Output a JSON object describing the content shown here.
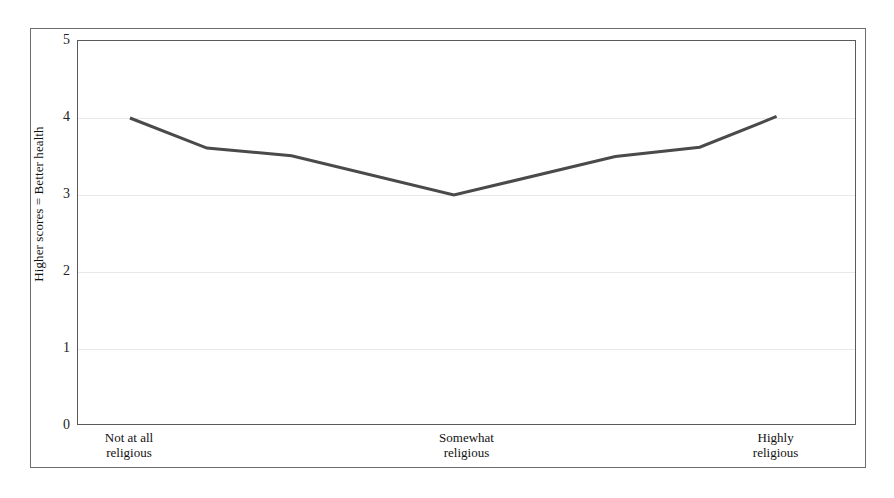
{
  "chart_data": {
    "type": "line",
    "title": "",
    "subtitle": "",
    "xlabel": "",
    "ylabel": "Higher scores = Better health",
    "ylim": [
      0,
      5
    ],
    "yticks": [
      0,
      1,
      2,
      3,
      4,
      5
    ],
    "ytick_labels": [
      "0",
      "1",
      "2",
      "3",
      "4",
      "5"
    ],
    "grid": true,
    "grid_axis": "y",
    "legend": false,
    "legend_position": "none",
    "categories": [
      "Not at all\nreligious",
      "Somewhat\nreligious",
      "Highly\nreligious"
    ],
    "category_positions": [
      0.0,
      0.5,
      1.0
    ],
    "xtick_labels": [
      "Not at all religious",
      "Somewhat religious",
      "Highly religious"
    ],
    "series": [
      {
        "name": "Self-rated health",
        "color": "#4a4a4a",
        "line_width": 3,
        "x": [
          0.0667,
          0.1655,
          0.2741,
          0.4825,
          0.6897,
          0.7981,
          0.8968
        ],
        "values": [
          4.0,
          3.61,
          3.51,
          3.0,
          3.5,
          3.62,
          4.02
        ]
      }
    ],
    "colors": {
      "line": "#4a4a4a",
      "grid": "#e8e8e8",
      "axis": "#5a5a5a",
      "outer_border": "#6e6e6e",
      "text": "#111111",
      "background": "#ffffff"
    }
  }
}
